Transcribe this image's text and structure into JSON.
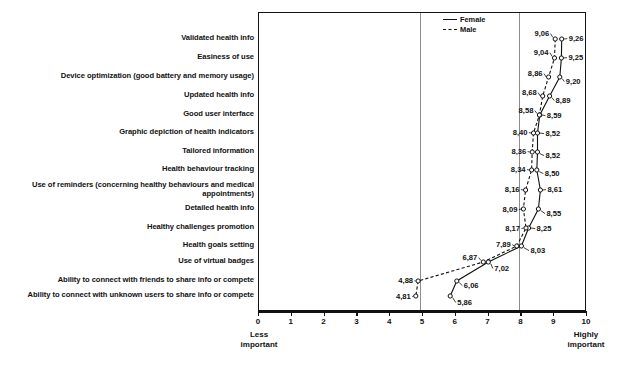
{
  "chart_data": {
    "type": "line",
    "title": "",
    "subtitle": "",
    "xlabel": "",
    "ylabel": "",
    "xlim": [
      0,
      10
    ],
    "grid": true,
    "gridlines_x": [
      5,
      8
    ],
    "orientation": "horizontal",
    "legend_position": "top-right",
    "xticks": [
      0,
      1,
      2,
      3,
      4,
      5,
      6,
      7,
      8,
      9,
      10
    ],
    "xticklabels": [
      "0",
      "1",
      "2",
      "3",
      "4",
      "5",
      "6",
      "7",
      "8",
      "9",
      "10"
    ],
    "axis_endcaps": {
      "left": "Less important",
      "left_line1": "Less",
      "left_line2": "important",
      "right": "Highly important",
      "right_line1": "Highly",
      "right_line2": "important"
    },
    "categories": [
      "Validated health info",
      "Easiness of use",
      "Device optimization (good battery and memory usage)",
      "Updated health info",
      "Good user interface",
      "Graphic depiction of health indicators",
      "Tailored information",
      "Health behaviour tracking",
      "Use of reminders (concerning healthy behaviours and medical appointments)",
      "Detailed health info",
      "Healthy challenges promotion",
      "Health goals setting",
      "Use of virtual badges",
      "Ability to connect with friends to share info or compete",
      "Ability to connect with unknown users to share info or compete"
    ],
    "series": [
      {
        "name": "Female",
        "style": "solid",
        "values": [
          9.26,
          9.25,
          9.2,
          8.89,
          8.59,
          8.52,
          8.52,
          8.5,
          8.61,
          8.55,
          8.25,
          8.03,
          7.02,
          6.06,
          5.86
        ],
        "labels": [
          "9,26",
          "9,25",
          "9,20",
          "8,89",
          "8,59",
          "8,52",
          "8,52",
          "8,50",
          "8,61",
          "8,55",
          "8,25",
          "8,03",
          "7,02",
          "6,06",
          "5,86"
        ]
      },
      {
        "name": "Male",
        "style": "dashed",
        "values": [
          9.06,
          9.04,
          8.86,
          8.68,
          8.58,
          8.4,
          8.36,
          8.34,
          8.16,
          8.09,
          8.17,
          7.89,
          6.87,
          4.88,
          4.81
        ],
        "labels": [
          "9,06",
          "9,04",
          "8,86",
          "8,68",
          "8,58",
          "8,40",
          "8,36",
          "8,34",
          "8,16",
          "8,09",
          "8,17",
          "7,89",
          "6,87",
          "4,88",
          "4,81"
        ]
      }
    ]
  },
  "legend": {
    "items": [
      {
        "label": "Female",
        "style": "solid"
      },
      {
        "label": "Male",
        "style": "dashed"
      }
    ]
  },
  "colors": {
    "line": "#111111",
    "grid": "#8d8d8d",
    "background": "#ffffff",
    "text": "#111111"
  }
}
